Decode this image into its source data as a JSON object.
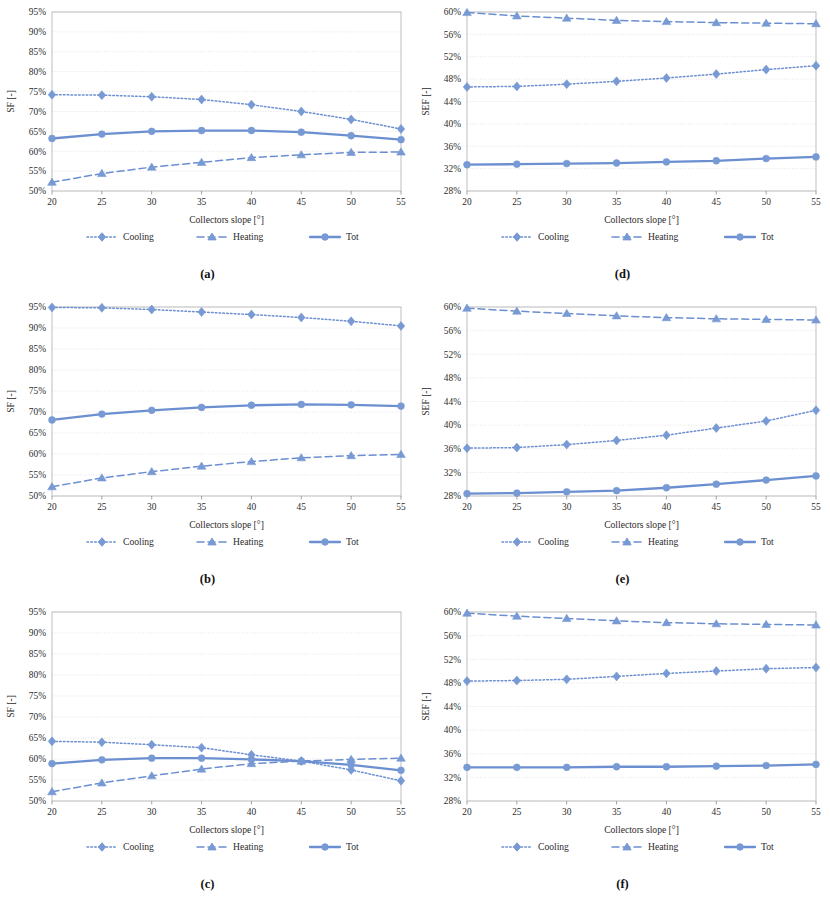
{
  "figure": {
    "series_names": [
      "Cooling",
      "Heating",
      "Tot"
    ],
    "accent_color": "#7799d4",
    "line_color": "#6b8fd0",
    "grid_color": "#d9d9d9",
    "axis_color": "#8c8c8c",
    "x_categories": [
      20,
      25,
      30,
      35,
      40,
      45,
      50,
      55
    ],
    "xlabel": "Collectors slope [°]",
    "ylabel_left": "SF [-]",
    "ylabel_right": "SEF [-]",
    "captions": [
      "(a)",
      "(b)",
      "(c)",
      "(d)",
      "(e)",
      "(f)"
    ]
  },
  "chart_data": [
    {
      "id": "a",
      "caption": "(a)",
      "type": "line",
      "title": "",
      "xlabel": "Collectors slope [°]",
      "ylabel": "SF [-]",
      "x": [
        20,
        25,
        30,
        35,
        40,
        45,
        50,
        55
      ],
      "xlim": [
        20,
        55
      ],
      "ylim": [
        50,
        95
      ],
      "yticks": [
        "50%",
        "55%",
        "60%",
        "65%",
        "70%",
        "75%",
        "80%",
        "85%",
        "90%",
        "95%"
      ],
      "ytick_values": [
        50,
        55,
        60,
        65,
        70,
        75,
        80,
        85,
        90,
        95
      ],
      "xticks": [
        "20",
        "25",
        "30",
        "35",
        "40",
        "45",
        "50",
        "55"
      ],
      "grid": true,
      "legend_position": "bottom",
      "series": [
        {
          "name": "Cooling",
          "style": "dotted",
          "marker": "diamond",
          "values": [
            74.2,
            74.1,
            73.7,
            73.0,
            71.7,
            70.0,
            68.0,
            65.6
          ]
        },
        {
          "name": "Heating",
          "style": "dashed",
          "marker": "triangle",
          "values": [
            52.2,
            54.4,
            56.0,
            57.2,
            58.4,
            59.1,
            59.7,
            59.8
          ]
        },
        {
          "name": "Tot",
          "style": "solid",
          "marker": "circle",
          "values": [
            63.2,
            64.3,
            65.0,
            65.2,
            65.2,
            64.8,
            63.9,
            62.9
          ]
        }
      ]
    },
    {
      "id": "b",
      "caption": "(b)",
      "type": "line",
      "title": "",
      "xlabel": "Collectors slope [°]",
      "ylabel": "SF [-]",
      "x": [
        20,
        25,
        30,
        35,
        40,
        45,
        50,
        55
      ],
      "xlim": [
        20,
        55
      ],
      "ylim": [
        50,
        95
      ],
      "yticks": [
        "50%",
        "55%",
        "60%",
        "65%",
        "70%",
        "75%",
        "80%",
        "85%",
        "90%",
        "95%"
      ],
      "ytick_values": [
        50,
        55,
        60,
        65,
        70,
        75,
        80,
        85,
        90,
        95
      ],
      "xticks": [
        "20",
        "25",
        "30",
        "35",
        "40",
        "45",
        "50",
        "55"
      ],
      "grid": true,
      "legend_position": "bottom",
      "series": [
        {
          "name": "Cooling",
          "style": "dotted",
          "marker": "diamond",
          "values": [
            94.9,
            94.8,
            94.4,
            93.8,
            93.2,
            92.5,
            91.6,
            90.5
          ]
        },
        {
          "name": "Heating",
          "style": "dashed",
          "marker": "triangle",
          "values": [
            52.2,
            54.3,
            55.8,
            57.1,
            58.2,
            59.1,
            59.6,
            59.9
          ]
        },
        {
          "name": "Tot",
          "style": "solid",
          "marker": "circle",
          "values": [
            68.1,
            69.5,
            70.4,
            71.1,
            71.6,
            71.8,
            71.7,
            71.4
          ]
        }
      ]
    },
    {
      "id": "c",
      "caption": "(c)",
      "type": "line",
      "title": "",
      "xlabel": "Collectors slope [°]",
      "ylabel": "SF [-]",
      "x": [
        20,
        25,
        30,
        35,
        40,
        45,
        50,
        55
      ],
      "xlim": [
        20,
        55
      ],
      "ylim": [
        50,
        95
      ],
      "yticks": [
        "50%",
        "55%",
        "60%",
        "65%",
        "70%",
        "75%",
        "80%",
        "85%",
        "90%",
        "95%"
      ],
      "ytick_values": [
        50,
        55,
        60,
        65,
        70,
        75,
        80,
        85,
        90,
        95
      ],
      "xticks": [
        "20",
        "25",
        "30",
        "35",
        "40",
        "45",
        "50",
        "55"
      ],
      "grid": true,
      "legend_position": "bottom",
      "series": [
        {
          "name": "Cooling",
          "style": "dotted",
          "marker": "diamond",
          "values": [
            64.2,
            64.0,
            63.4,
            62.7,
            61.0,
            59.5,
            57.4,
            54.8
          ]
        },
        {
          "name": "Heating",
          "style": "dashed",
          "marker": "triangle",
          "values": [
            52.2,
            54.3,
            56.0,
            57.6,
            58.9,
            59.5,
            59.9,
            60.2
          ]
        },
        {
          "name": "Tot",
          "style": "solid",
          "marker": "circle",
          "values": [
            58.9,
            59.8,
            60.2,
            60.2,
            59.9,
            59.5,
            58.6,
            57.3
          ]
        }
      ]
    },
    {
      "id": "d",
      "caption": "(d)",
      "type": "line",
      "title": "",
      "xlabel": "Collectors slope [°]",
      "ylabel": "SEF [-]",
      "x": [
        20,
        25,
        30,
        35,
        40,
        45,
        50,
        55
      ],
      "xlim": [
        20,
        55
      ],
      "ylim": [
        28,
        60
      ],
      "yticks": [
        "28%",
        "32%",
        "36%",
        "40%",
        "44%",
        "48%",
        "52%",
        "56%",
        "60%"
      ],
      "ytick_values": [
        28,
        32,
        36,
        40,
        44,
        48,
        52,
        56,
        60
      ],
      "xticks": [
        "20",
        "25",
        "30",
        "35",
        "40",
        "45",
        "50",
        "55"
      ],
      "grid": true,
      "legend_position": "bottom",
      "series": [
        {
          "name": "Cooling",
          "style": "dotted",
          "marker": "diamond",
          "values": [
            46.6,
            46.7,
            47.1,
            47.6,
            48.2,
            48.9,
            49.7,
            50.4
          ]
        },
        {
          "name": "Heating",
          "style": "dashed",
          "marker": "triangle",
          "values": [
            59.9,
            59.3,
            58.9,
            58.5,
            58.3,
            58.1,
            58.0,
            57.9
          ]
        },
        {
          "name": "Tot",
          "style": "solid",
          "marker": "circle",
          "values": [
            32.7,
            32.8,
            32.9,
            33.0,
            33.2,
            33.4,
            33.8,
            34.1
          ]
        }
      ]
    },
    {
      "id": "e",
      "caption": "(e)",
      "type": "line",
      "title": "",
      "xlabel": "Collectors slope [°]",
      "ylabel": "SEF [-]",
      "x": [
        20,
        25,
        30,
        35,
        40,
        45,
        50,
        55
      ],
      "xlim": [
        20,
        55
      ],
      "ylim": [
        28,
        60
      ],
      "yticks": [
        "28%",
        "32%",
        "36%",
        "40%",
        "44%",
        "48%",
        "52%",
        "56%",
        "60%"
      ],
      "ytick_values": [
        28,
        32,
        36,
        40,
        44,
        48,
        52,
        56,
        60
      ],
      "xticks": [
        "20",
        "25",
        "30",
        "35",
        "40",
        "45",
        "50",
        "55"
      ],
      "grid": true,
      "legend_position": "bottom",
      "series": [
        {
          "name": "Cooling",
          "style": "dotted",
          "marker": "diamond",
          "values": [
            36.1,
            36.2,
            36.7,
            37.4,
            38.3,
            39.5,
            40.7,
            42.5
          ]
        },
        {
          "name": "Heating",
          "style": "dashed",
          "marker": "triangle",
          "values": [
            59.8,
            59.3,
            58.9,
            58.5,
            58.2,
            58.0,
            57.9,
            57.8
          ]
        },
        {
          "name": "Tot",
          "style": "solid",
          "marker": "circle",
          "values": [
            28.4,
            28.5,
            28.7,
            28.9,
            29.4,
            30.0,
            30.7,
            31.4
          ]
        }
      ]
    },
    {
      "id": "f",
      "caption": "(f)",
      "type": "line",
      "title": "",
      "xlabel": "Collectors slope [°]",
      "ylabel": "SEF [-]",
      "x": [
        20,
        25,
        30,
        35,
        40,
        45,
        50,
        55
      ],
      "xlim": [
        28,
        60
      ],
      "ylim": [
        28,
        60
      ],
      "yticks": [
        "28%",
        "32%",
        "36%",
        "40%",
        "44%",
        "48%",
        "52%",
        "56%",
        "60%"
      ],
      "ytick_values": [
        28,
        32,
        36,
        40,
        44,
        48,
        52,
        56,
        60
      ],
      "xticks": [
        "20",
        "25",
        "30",
        "35",
        "40",
        "45",
        "50",
        "55"
      ],
      "grid": true,
      "legend_position": "bottom",
      "series": [
        {
          "name": "Cooling",
          "style": "dotted",
          "marker": "diamond",
          "values": [
            48.3,
            48.4,
            48.6,
            49.1,
            49.6,
            50.0,
            50.4,
            50.6
          ]
        },
        {
          "name": "Heating",
          "style": "dashed",
          "marker": "triangle",
          "values": [
            59.8,
            59.3,
            58.9,
            58.5,
            58.2,
            58.0,
            57.9,
            57.8
          ]
        },
        {
          "name": "Tot",
          "style": "solid",
          "marker": "circle",
          "values": [
            33.7,
            33.7,
            33.7,
            33.8,
            33.8,
            33.9,
            34.0,
            34.2
          ]
        }
      ]
    }
  ]
}
